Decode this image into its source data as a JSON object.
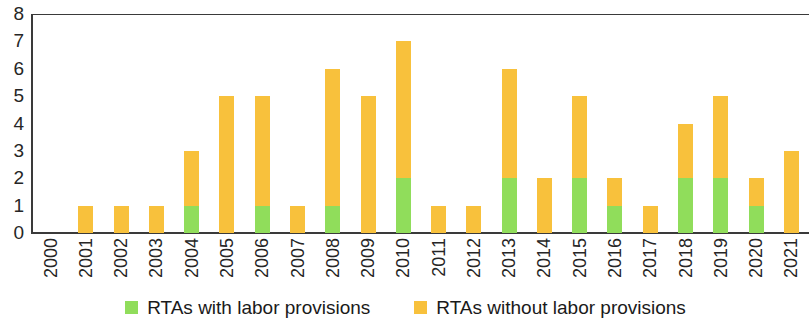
{
  "chart_data": {
    "type": "bar",
    "stacked": true,
    "title": "",
    "subtitle": "",
    "xlabel": "",
    "ylabel": "",
    "ylim": [
      0,
      8
    ],
    "ytick_labels": [
      "8",
      "7",
      "6",
      "5",
      "4",
      "3",
      "2",
      "1",
      "0"
    ],
    "ytick_values": [
      8,
      7,
      6,
      5,
      4,
      3,
      2,
      1,
      0
    ],
    "grid": false,
    "legend_position": "bottom",
    "categories": [
      "2000",
      "2001",
      "2002",
      "2003",
      "2004",
      "2005",
      "2006",
      "2007",
      "2008",
      "2009",
      "2010",
      "2011",
      "2012",
      "2013",
      "2014",
      "2015",
      "2016",
      "2017",
      "2018",
      "2019",
      "2020",
      "2021"
    ],
    "series": [
      {
        "name": "RTAs with labor provisions",
        "color": "#90dd5b",
        "values": [
          0,
          0,
          0,
          0,
          1,
          0,
          1,
          0,
          1,
          0,
          2,
          0,
          0,
          2,
          0,
          2,
          1,
          0,
          2,
          2,
          1,
          0
        ]
      },
      {
        "name": "RTAs without labor provisions",
        "color": "#f8c13c",
        "values": [
          0,
          1,
          1,
          1,
          2,
          5,
          4,
          1,
          5,
          5,
          5,
          1,
          1,
          4,
          2,
          3,
          1,
          1,
          2,
          3,
          1,
          3
        ]
      }
    ],
    "totals": [
      0,
      1,
      1,
      1,
      3,
      5,
      5,
      1,
      6,
      5,
      7,
      1,
      1,
      6,
      2,
      5,
      2,
      1,
      4,
      5,
      2,
      3
    ]
  },
  "legend": {
    "items": [
      {
        "label": "RTAs with labor provisions",
        "swatch": "green-square-icon"
      },
      {
        "label": "RTAs without labor provisions",
        "swatch": "orange-square-icon"
      }
    ]
  }
}
